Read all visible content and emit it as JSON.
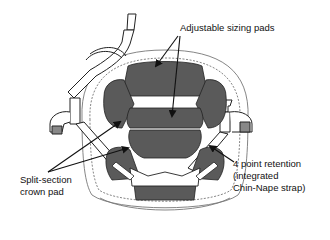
{
  "diagram": {
    "colors": {
      "pad_fill": "#5a5a5a",
      "line": "#222222",
      "shell_line": "#777777",
      "background": "#ffffff"
    },
    "callouts": [
      {
        "id": "adjustable-sizing-pads",
        "lines": [
          "Adjustable sizing pads"
        ],
        "arrow_count": 2
      },
      {
        "id": "four-point-retention",
        "lines": [
          "4 point retention",
          "(integrated",
          "Chin-Nape strap)"
        ],
        "arrow_count": 1
      },
      {
        "id": "split-section-crown-pad",
        "lines": [
          "Split-section",
          "crown pad"
        ],
        "arrow_count": 2
      }
    ]
  }
}
